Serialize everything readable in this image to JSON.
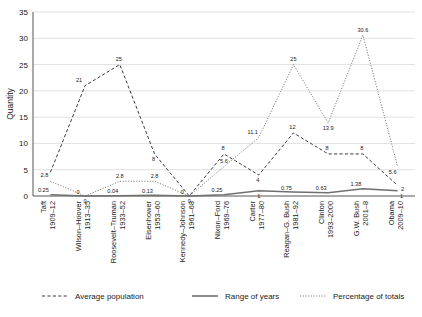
{
  "chart_data": {
    "type": "line",
    "title": "",
    "xlabel": "",
    "ylabel": "Quantity",
    "ylim": [
      0,
      35
    ],
    "yticks": [
      0,
      5,
      10,
      15,
      20,
      25,
      30,
      35
    ],
    "grid": true,
    "legend_position": "bottom",
    "categories": [
      "Taft\n1909–12",
      "Wilson–Hoover\n1913–35",
      "Roosevelt–Truman\n1933–52",
      "Eisenhower\n1953–60",
      "Kennedy–Johnson\n1961–68",
      "Nixon–Ford\n1969–76",
      "Carter\n1977–80",
      "Reagan–G. Bush\n1981–92",
      "Clinton\n1993–2000",
      "G.W. Bush\n2001–8",
      "Obama\n2009–10"
    ],
    "category_lines": [
      [
        "Taft",
        "1909–12"
      ],
      [
        "Wilson–Hoover",
        "1913–35"
      ],
      [
        "Roosevelt–Truman",
        "1933–52"
      ],
      [
        "Eisenhower",
        "1953–60"
      ],
      [
        "Kennedy–Johnson",
        "1961–68"
      ],
      [
        "Nixon–Ford",
        "1969–76"
      ],
      [
        "Carter",
        "1977–80"
      ],
      [
        "Reagan–G. Bush",
        "1981–92"
      ],
      [
        "Clinton",
        "1993–2000"
      ],
      [
        "G.W. Bush",
        "2001–8"
      ],
      [
        "Obama",
        "2009–10"
      ]
    ],
    "series": [
      {
        "name": "Average population",
        "style": "dashed",
        "color": "#3a3a3a",
        "values": [
          4.5,
          21,
          25,
          8,
          0,
          8,
          4,
          12,
          8,
          8,
          2
        ],
        "labels": [
          "",
          "21",
          "25",
          "8",
          "",
          "8",
          "4",
          "12",
          "8",
          "8",
          "2"
        ]
      },
      {
        "name": "Range of years",
        "style": "solid",
        "color": "#707070",
        "values": [
          0.25,
          0,
          0.04,
          0.13,
          0,
          0.25,
          1,
          0.75,
          0.63,
          1.38,
          1
        ],
        "labels": [
          "0.25",
          "0",
          "0.04",
          "0.13",
          "0",
          "0.25",
          "1",
          "0.75",
          "0.63",
          "1.38",
          "1"
        ]
      },
      {
        "name": "Percentage of totals",
        "style": "dotted",
        "color": "#6b6b6b",
        "values": [
          2.8,
          0,
          2.8,
          2.8,
          0,
          5.6,
          11.1,
          25,
          13.9,
          30.6,
          5.6
        ],
        "labels": [
          "2.8",
          "0",
          "2.8",
          "2.8",
          "0",
          "5.6",
          "11.1",
          "25",
          "13.9",
          "30.6",
          "5.6"
        ]
      }
    ]
  },
  "legend": {
    "items": [
      {
        "label": "Average population",
        "style": "dashed"
      },
      {
        "label": "Range of years",
        "style": "solid"
      },
      {
        "label": "Percentage of totals",
        "style": "dotted"
      }
    ]
  }
}
